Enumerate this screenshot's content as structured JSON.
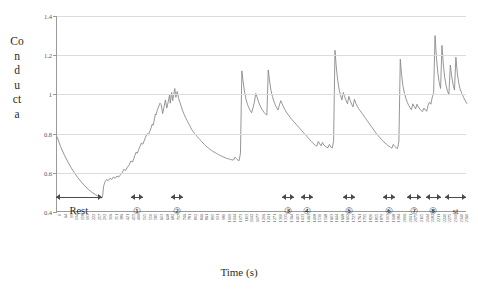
{
  "chart_data": {
    "type": "line",
    "title": "",
    "xlabel": "Time (s)",
    "ylabel": "Conducta",
    "ylabel_lines": [
      "Co",
      "n",
      "d",
      "u",
      "ct",
      "a"
    ],
    "ylim": [
      0.4,
      1.4
    ],
    "yticks": [
      0.4,
      0.6,
      0.8,
      1,
      1.2,
      1.4
    ],
    "ytick_labels": [
      "0.4",
      "0.6",
      "0.8",
      "1",
      "1.2",
      "1.4"
    ],
    "grid": true,
    "legend": "none",
    "line_color": "#8a8a8a",
    "xlim": [
      0,
      2360
    ],
    "xtick_labels": [
      "0",
      "64",
      "99",
      "134",
      "158",
      "193",
      "222",
      "257",
      "292",
      "316",
      "351",
      "386",
      "421",
      "455",
      "490",
      "515",
      "550",
      "585",
      "613",
      "648",
      "682",
      "717",
      "746",
      "781",
      "802",
      "846",
      "861",
      "895",
      "931",
      "980",
      "1009",
      "1044",
      "1073",
      "1113",
      "1142",
      "1177",
      "1206",
      "1241",
      "1271",
      "1300",
      "1335",
      "1364",
      "1403",
      "1433",
      "1463",
      "1498",
      "1530",
      "1568",
      "1603",
      "1644",
      "1668",
      "1692",
      "1727",
      "1761",
      "1795",
      "1820",
      "1855",
      "1879",
      "1913",
      "1948",
      "1984",
      "2006",
      "2041",
      "2075",
      "2115",
      "2144",
      "2182",
      "2211",
      "2240",
      "2275",
      "2310",
      "2340",
      "2360"
    ],
    "x": [
      0,
      20,
      40,
      60,
      80,
      100,
      120,
      140,
      160,
      180,
      200,
      220,
      240,
      250,
      255,
      258,
      262,
      268,
      275,
      285,
      295,
      305,
      315,
      325,
      335,
      345,
      355,
      365,
      375,
      385,
      395,
      405,
      415,
      425,
      435,
      442,
      448,
      455,
      462,
      470,
      478,
      486,
      494,
      502,
      510,
      518,
      526,
      534,
      542,
      548,
      553,
      558,
      562,
      566,
      570,
      576,
      584,
      592,
      600,
      608,
      616,
      624,
      632,
      640,
      648,
      652,
      656,
      660,
      666,
      672,
      678,
      684,
      692,
      700,
      708,
      716,
      724,
      732,
      740,
      748,
      756,
      762,
      766,
      770,
      776,
      784,
      792,
      800,
      808,
      816,
      824,
      832,
      840,
      848,
      856,
      864,
      872,
      880,
      888,
      896,
      904,
      912,
      920,
      928,
      936,
      944,
      952,
      960,
      968,
      976,
      984,
      992,
      1000,
      1008,
      1016,
      1024,
      1032,
      1040,
      1048,
      1056,
      1064,
      1072,
      1080,
      1088,
      1096,
      1104,
      1112,
      1120,
      1128,
      1136,
      1144,
      1152,
      1160,
      1168,
      1176,
      1184,
      1192,
      1200,
      1208,
      1216,
      1224,
      1232,
      1240,
      1248,
      1256,
      1264,
      1272,
      1280,
      1288,
      1296,
      1304,
      1312,
      1320,
      1328,
      1336,
      1344,
      1352,
      1360,
      1368,
      1376,
      1384,
      1392,
      1400,
      1408,
      1416,
      1424,
      1432,
      1440,
      1448,
      1456,
      1464,
      1472,
      1480,
      1488,
      1496,
      1504,
      1512,
      1520,
      1528,
      1536,
      1544,
      1552,
      1560,
      1568,
      1576,
      1584,
      1592,
      1600,
      1608,
      1616,
      1624,
      1632,
      1640,
      1648,
      1656,
      1664,
      1672,
      1680,
      1688,
      1696,
      1704,
      1712,
      1720,
      1728,
      1736,
      1744,
      1752,
      1760,
      1768,
      1776,
      1784,
      1792,
      1800,
      1808,
      1816,
      1824,
      1832,
      1840,
      1848,
      1856,
      1864,
      1872,
      1880,
      1888,
      1896,
      1904,
      1912,
      1920,
      1928,
      1936,
      1944,
      1952,
      1960,
      1968,
      1976,
      1984,
      1992,
      2000,
      2008,
      2016,
      2024,
      2032,
      2040,
      2048,
      2056,
      2064,
      2072,
      2080,
      2088,
      2096,
      2104,
      2112,
      2120,
      2128,
      2136,
      2144,
      2152,
      2160,
      2168,
      2176,
      2184,
      2192,
      2200,
      2208,
      2216,
      2224,
      2232,
      2240,
      2248,
      2256,
      2264,
      2272,
      2280,
      2288,
      2296,
      2304,
      2312,
      2320,
      2330,
      2340,
      2350,
      2360
    ],
    "y": [
      0.785,
      0.735,
      0.695,
      0.66,
      0.628,
      0.6,
      0.575,
      0.553,
      0.533,
      0.516,
      0.501,
      0.489,
      0.479,
      0.474,
      0.472,
      0.471,
      0.478,
      0.53,
      0.552,
      0.566,
      0.56,
      0.572,
      0.566,
      0.578,
      0.572,
      0.584,
      0.578,
      0.59,
      0.6,
      0.618,
      0.612,
      0.628,
      0.64,
      0.66,
      0.655,
      0.672,
      0.688,
      0.705,
      0.7,
      0.718,
      0.735,
      0.752,
      0.746,
      0.763,
      0.782,
      0.8,
      0.793,
      0.812,
      0.83,
      0.848,
      0.842,
      0.86,
      0.88,
      0.9,
      0.895,
      0.916,
      0.935,
      0.955,
      0.948,
      0.902,
      0.935,
      0.972,
      0.93,
      0.962,
      0.998,
      0.955,
      0.985,
      1.01,
      0.968,
      1.0,
      1.03,
      0.985,
      1.015,
      0.98,
      0.958,
      0.936,
      0.915,
      0.898,
      0.882,
      0.868,
      0.855,
      0.845,
      0.838,
      0.83,
      0.82,
      0.81,
      0.8,
      0.792,
      0.784,
      0.776,
      0.768,
      0.76,
      0.752,
      0.745,
      0.738,
      0.732,
      0.726,
      0.72,
      0.715,
      0.71,
      0.706,
      0.702,
      0.698,
      0.694,
      0.69,
      0.686,
      0.683,
      0.68,
      0.677,
      0.674,
      0.672,
      0.67,
      0.668,
      0.666,
      0.665,
      0.68,
      0.672,
      0.666,
      0.662,
      0.7,
      1.12,
      1.06,
      1.01,
      0.975,
      0.95,
      0.932,
      0.918,
      0.906,
      0.93,
      0.96,
      1.005,
      0.985,
      0.962,
      0.945,
      0.93,
      0.918,
      0.908,
      0.9,
      0.894,
      1.125,
      1.065,
      1.02,
      0.99,
      0.966,
      0.948,
      0.932,
      0.92,
      0.945,
      0.968,
      0.952,
      0.936,
      0.922,
      0.91,
      0.9,
      0.89,
      0.88,
      0.872,
      0.864,
      0.856,
      0.848,
      0.84,
      0.832,
      0.824,
      0.816,
      0.808,
      0.8,
      0.792,
      0.784,
      0.776,
      0.768,
      0.76,
      0.752,
      0.746,
      0.74,
      0.736,
      0.76,
      0.748,
      0.738,
      0.755,
      0.742,
      0.735,
      0.73,
      0.728,
      0.745,
      0.732,
      0.726,
      0.76,
      1.225,
      1.135,
      1.07,
      1.025,
      0.995,
      0.972,
      1.01,
      0.988,
      0.968,
      0.952,
      0.99,
      0.968,
      0.95,
      0.936,
      0.975,
      0.955,
      0.94,
      0.928,
      0.918,
      0.908,
      0.898,
      0.888,
      0.878,
      0.868,
      0.858,
      0.848,
      0.838,
      0.828,
      0.818,
      0.808,
      0.798,
      0.79,
      0.782,
      0.774,
      0.766,
      0.758,
      0.752,
      0.746,
      0.74,
      0.735,
      0.73,
      0.726,
      0.745,
      0.735,
      0.728,
      0.724,
      0.76,
      1.18,
      1.095,
      1.04,
      1.005,
      0.98,
      0.96,
      0.945,
      0.932,
      0.922,
      0.952,
      0.938,
      0.926,
      0.95,
      0.936,
      0.926,
      0.918,
      0.912,
      0.93,
      0.92,
      0.914,
      0.945,
      0.96,
      0.95,
      0.985,
      1.01,
      1.3,
      1.19,
      1.11,
      1.06,
      1.03,
      1.25,
      1.15,
      1.085,
      1.045,
      1.015,
      1.0,
      1.15,
      1.09,
      1.05,
      1.022,
      1.19,
      1.11,
      1.06,
      1.028,
      1.005,
      0.985,
      0.968,
      0.952,
      0.938,
      0.925,
      0.912,
      0.9,
      0.89,
      0.88,
      0.87,
      0.862,
      0.854,
      0.846,
      0.84,
      0.834,
      0.828,
      0.824,
      0.82,
      0.818,
      0.817,
      0.816
    ]
  },
  "annotations": {
    "rest": {
      "label": "Rest",
      "start": 0,
      "end": 262
    },
    "segments": [
      {
        "label": "①",
        "start": 430,
        "end": 500
      },
      {
        "label": "②",
        "start": 660,
        "end": 730
      },
      {
        "label": "③",
        "start": 1300,
        "end": 1370
      },
      {
        "label": "④",
        "start": 1410,
        "end": 1480
      },
      {
        "label": "⑤",
        "start": 1650,
        "end": 1720
      },
      {
        "label": "⑥",
        "start": 1880,
        "end": 1950
      },
      {
        "label": "⑦",
        "start": 2020,
        "end": 2100
      },
      {
        "label": "⑧",
        "start": 2130,
        "end": 2215
      },
      {
        "label": "st",
        "start": 2240,
        "end": 2360
      }
    ]
  }
}
